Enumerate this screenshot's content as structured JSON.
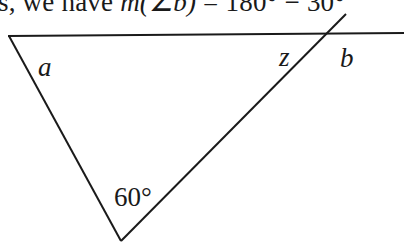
{
  "header_text": {
    "prefix": "s, we have ",
    "measure_expr": "m(∠b)",
    "equals_part": " = 180° − ",
    "value_part": "30°"
  },
  "diagram": {
    "labels": {
      "angle_a": "a",
      "angle_z": "z",
      "angle_b": "b",
      "angle_bottom": "60°"
    },
    "line_color": "#1a1a1a"
  }
}
